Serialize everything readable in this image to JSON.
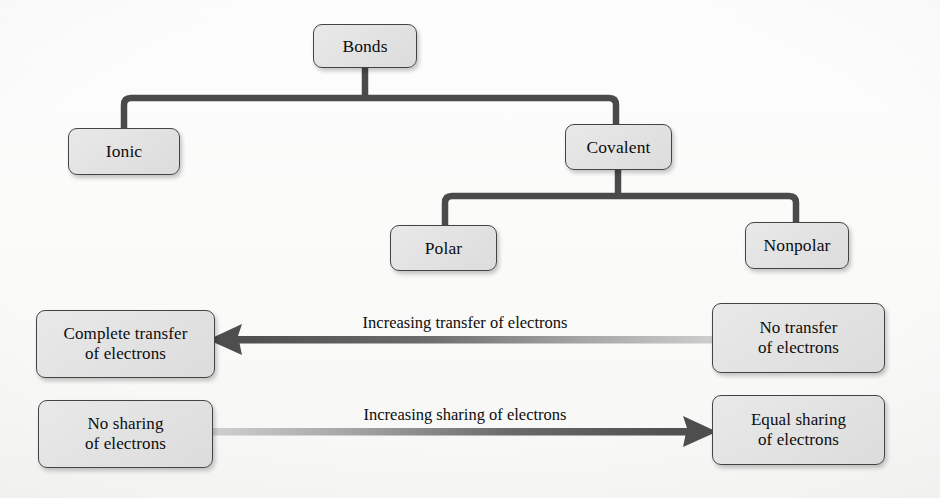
{
  "diagram": {
    "colors": {
      "node_fill": "#e4e4e4",
      "node_border": "#444444",
      "connector": "#4a4a4a",
      "arrow_dark": "#4e4e4e",
      "arrow_light": "#c9c9c9",
      "text": "#0d0d0d",
      "background": "#fdfdfd"
    },
    "tree": {
      "root": {
        "label": "Bonds"
      },
      "level2": [
        {
          "label": "Ionic"
        },
        {
          "label": "Covalent"
        }
      ],
      "level3": [
        {
          "label": "Polar"
        },
        {
          "label": "Nonpolar"
        }
      ]
    },
    "spectrum_rows": [
      {
        "label": "Increasing transfer of electrons",
        "direction": "right-to-left",
        "left_box": "Complete transfer\nof electrons",
        "right_box": "No transfer\nof electrons"
      },
      {
        "label": "Increasing sharing of electrons",
        "direction": "left-to-right",
        "left_box": "No sharing\nof electrons",
        "right_box": "Equal sharing\nof electrons"
      }
    ]
  }
}
